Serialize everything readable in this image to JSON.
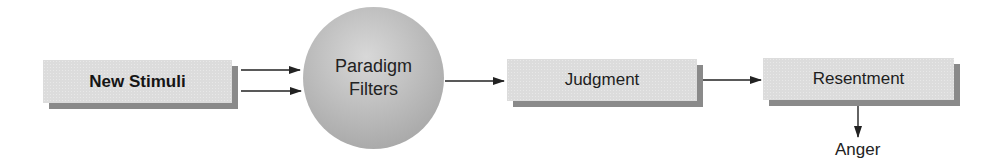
{
  "diagram": {
    "nodes": {
      "new_stimuli": {
        "label": "New Stimuli",
        "shape": "box",
        "emphasis": "bold"
      },
      "paradigm_filters": {
        "line1": "Paradigm",
        "line2": "Filters",
        "shape": "circle"
      },
      "judgment": {
        "label": "Judgment",
        "shape": "box"
      },
      "resentment": {
        "label": "Resentment",
        "shape": "box"
      },
      "anger": {
        "label": "Anger",
        "shape": "text"
      }
    },
    "edges": [
      {
        "from": "New Stimuli",
        "to": "Paradigm Filters",
        "count": 2
      },
      {
        "from": "Paradigm Filters",
        "to": "Judgment"
      },
      {
        "from": "Judgment",
        "to": "Resentment"
      },
      {
        "from": "Resentment",
        "to": "Anger",
        "direction": "down"
      }
    ],
    "colors": {
      "box_fill": "#dcdcdc",
      "box_shadow": "#8a8a8a",
      "circle_fill": "#b8b8b8",
      "arrow": "#222222",
      "text": "#1e1e1e"
    }
  }
}
